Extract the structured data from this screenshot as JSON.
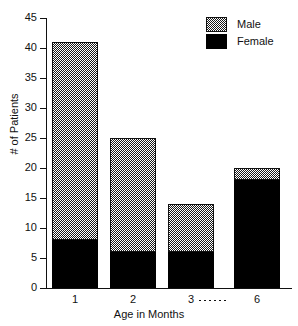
{
  "chart_data": {
    "type": "bar",
    "subtype": "stacked-bar",
    "title": "",
    "xlabel": "Age in Months",
    "ylabel": "# of Patients",
    "categories": [
      "1",
      "2",
      "3",
      "6"
    ],
    "series": [
      {
        "name": "Female",
        "values": [
          8,
          6,
          6,
          18
        ],
        "color": "#000000",
        "fill": "solid-black"
      },
      {
        "name": "Male",
        "values": [
          33,
          19,
          8,
          2
        ],
        "color": "#808080",
        "fill": "checkered-gray"
      }
    ],
    "stack_order": [
      "Female",
      "Male"
    ],
    "totals": [
      41,
      25,
      14,
      20
    ],
    "ylim": [
      0,
      45
    ],
    "yticks": [
      0,
      5,
      10,
      15,
      20,
      25,
      30,
      35,
      40,
      45
    ],
    "ytick_labels": [
      "0",
      "5",
      "10",
      "15",
      "20",
      "25",
      "30",
      "35",
      "40",
      "45"
    ],
    "grid": false,
    "legend_position": "top-right",
    "legend_entries": [
      "Male",
      "Female"
    ],
    "annotations": [
      {
        "name": "x-axis-break",
        "type": "dotted-line",
        "between": [
          "3",
          "6"
        ]
      }
    ]
  },
  "axes": {
    "y_title": "# of Patients",
    "x_title": "Age in Months"
  },
  "legend": {
    "items": [
      {
        "label": "Male",
        "swatch": "checkered-gray-swatch"
      },
      {
        "label": "Female",
        "swatch": "solid-black-swatch"
      }
    ]
  }
}
